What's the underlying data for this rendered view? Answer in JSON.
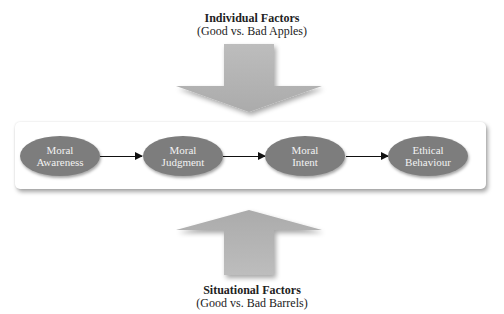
{
  "top_factor": {
    "title": "Individual Factors",
    "subtitle": "(Good vs. Bad Apples)",
    "arrow_direction": "down"
  },
  "bottom_factor": {
    "title": "Situational Factors",
    "subtitle": "(Good vs. Bad Barrels)",
    "arrow_direction": "up"
  },
  "process_steps": [
    {
      "line1": "Moral",
      "line2": "Awareness"
    },
    {
      "line1": "Moral",
      "line2": "Judgment"
    },
    {
      "line1": "Moral",
      "line2": "Intent"
    },
    {
      "line1": "Ethical",
      "line2": "Behaviour"
    }
  ],
  "colors": {
    "oval_fill": "#7d7d7d",
    "oval_text": "#f2f2f2",
    "arrow_fill": "#b4b4b4",
    "connector": "#111111"
  }
}
